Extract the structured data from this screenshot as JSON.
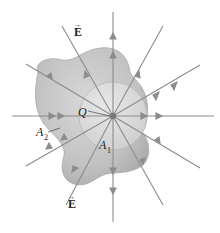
{
  "diagram": {
    "labels": {
      "field_top": "E",
      "field_bottom": "E",
      "charge": "Q",
      "surface_outer": "A",
      "surface_outer_sub": "2",
      "surface_inner": "A",
      "surface_inner_sub": "1"
    },
    "center": [
      113,
      116
    ],
    "colors": {
      "blob_fill": "#c4c4c4",
      "blob_edge": "#a9a9a9",
      "sphere_fill": "#dcdcdc",
      "sphere_edge": "#b5b5b5",
      "field_line": "#8a8a8a",
      "charge": "#777777",
      "text": "#222222"
    },
    "field_lines": [
      {
        "angle": 0
      },
      {
        "angle": 30
      },
      {
        "angle": 60
      },
      {
        "angle": 90
      },
      {
        "angle": 120
      },
      {
        "angle": 150
      },
      {
        "angle": 180
      },
      {
        "angle": 210
      },
      {
        "angle": 240
      },
      {
        "angle": 270
      },
      {
        "angle": 300
      },
      {
        "angle": 330
      }
    ]
  }
}
